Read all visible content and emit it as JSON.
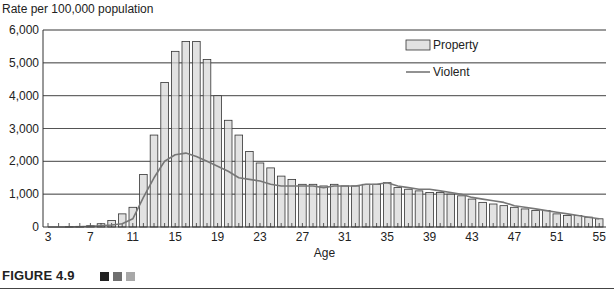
{
  "figure": {
    "caption": "FIGURE 4.9",
    "square_colors": [
      "#222222",
      "#6f6f6f",
      "#a8a8a8"
    ]
  },
  "chart_data": {
    "type": "bar",
    "title": "",
    "ylabel": "Rate per 100,000 population",
    "xlabel": "Age",
    "ylim": [
      0,
      6000
    ],
    "yticks": [
      0,
      1000,
      2000,
      3000,
      4000,
      5000,
      6000
    ],
    "ytick_labels": [
      "0",
      "1,000",
      "2,000",
      "3,000",
      "4,000",
      "5,000",
      "6,000"
    ],
    "xticks_labeled": [
      3,
      7,
      11,
      15,
      19,
      23,
      27,
      31,
      35,
      39,
      43,
      47,
      51,
      55
    ],
    "grid": "horizontal",
    "legend": {
      "position": "upper right",
      "entries": [
        "Property",
        "Violent"
      ]
    },
    "categories": [
      3,
      4,
      5,
      6,
      7,
      8,
      9,
      10,
      11,
      12,
      13,
      14,
      15,
      16,
      17,
      18,
      19,
      20,
      21,
      22,
      23,
      24,
      25,
      26,
      27,
      28,
      29,
      30,
      31,
      32,
      33,
      34,
      35,
      36,
      37,
      38,
      39,
      40,
      41,
      42,
      43,
      44,
      45,
      46,
      47,
      48,
      49,
      50,
      51,
      52,
      53,
      54,
      55
    ],
    "series": [
      {
        "name": "Property",
        "kind": "bar",
        "color": "#e2e2e2",
        "values": [
          0,
          0,
          10,
          20,
          40,
          100,
          200,
          400,
          600,
          1600,
          2800,
          4400,
          5350,
          5650,
          5650,
          5100,
          4000,
          3250,
          2800,
          2300,
          1950,
          1800,
          1550,
          1450,
          1300,
          1300,
          1250,
          1300,
          1250,
          1250,
          1300,
          1300,
          1350,
          1200,
          1150,
          1100,
          1050,
          1050,
          1000,
          950,
          850,
          750,
          700,
          650,
          600,
          550,
          500,
          500,
          400,
          350,
          350,
          300,
          250
        ]
      },
      {
        "name": "Violent",
        "kind": "line",
        "color": "#777777",
        "values": [
          0,
          0,
          0,
          10,
          20,
          40,
          60,
          100,
          250,
          900,
          1500,
          2000,
          2200,
          2250,
          2150,
          2000,
          1850,
          1700,
          1500,
          1450,
          1400,
          1300,
          1250,
          1250,
          1250,
          1250,
          1200,
          1250,
          1250,
          1250,
          1300,
          1300,
          1350,
          1250,
          1200,
          1150,
          1150,
          1100,
          1050,
          1000,
          900,
          850,
          800,
          750,
          650,
          600,
          550,
          500,
          450,
          400,
          350,
          300,
          250
        ]
      }
    ]
  }
}
